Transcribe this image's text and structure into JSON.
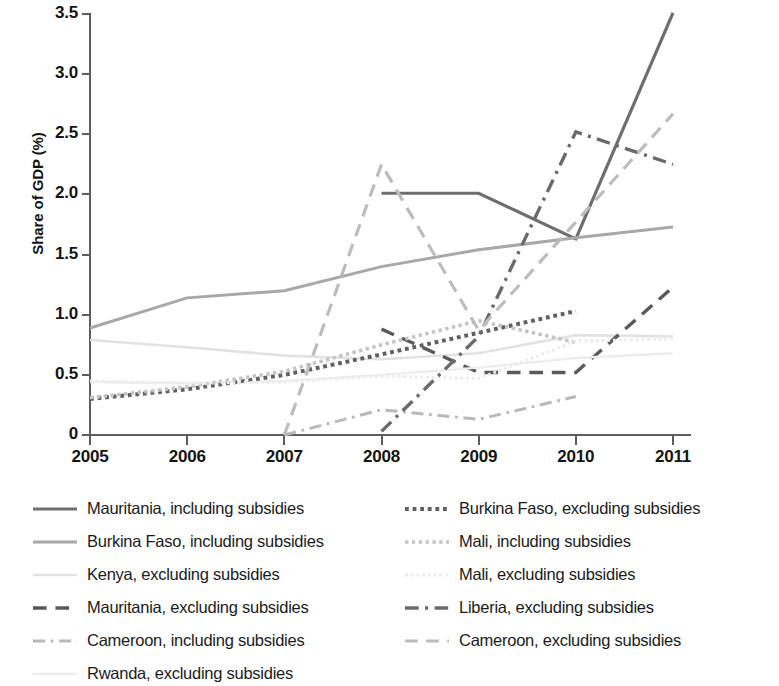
{
  "chart_data": {
    "type": "line",
    "title": "",
    "xlabel": "",
    "ylabel": "Share of GDP (%)",
    "x": [
      2005,
      2006,
      2007,
      2008,
      2009,
      2010,
      2011
    ],
    "xtick_labels": [
      "2005",
      "2006",
      "2007",
      "2008",
      "2009",
      "2010",
      "2011"
    ],
    "ytick_labels": [
      "0",
      "0.5",
      "1.0",
      "1.5",
      "2.0",
      "2.5",
      "3.0",
      "3.5"
    ],
    "ytick_values": [
      0,
      0.5,
      1.0,
      1.5,
      2.0,
      2.5,
      3.0,
      3.5
    ],
    "ylim": [
      0,
      3.5
    ],
    "xlim": [
      2005,
      2011
    ],
    "grid": false,
    "legend_position": "below",
    "series": [
      {
        "name": "Mauritania, including subsidies",
        "style": "solid",
        "color": "#6e6e6e",
        "width": 3.2,
        "x": [
          2008,
          2009,
          2010,
          2011
        ],
        "values": [
          2.01,
          2.01,
          1.63,
          3.51
        ]
      },
      {
        "name": "Burkina Faso, including subsidies",
        "style": "solid",
        "color": "#a8a8a8",
        "width": 3.0,
        "x": [
          2005,
          2006,
          2007,
          2008,
          2009,
          2010,
          2011
        ],
        "values": [
          0.89,
          1.14,
          1.2,
          1.4,
          1.54,
          1.64,
          1.73
        ]
      },
      {
        "name": "Kenya, excluding subsidies",
        "style": "solid",
        "color": "#e2e2e2",
        "width": 2.6,
        "x": [
          2005,
          2006,
          2007,
          2008,
          2009,
          2010,
          2011
        ],
        "values": [
          0.79,
          0.73,
          0.66,
          0.63,
          0.68,
          0.83,
          0.82
        ]
      },
      {
        "name": "Mauritania, excluding subsidies",
        "style": "dashed",
        "color": "#5a5a5a",
        "width": 3.4,
        "x": [
          2008,
          2009,
          2010,
          2011
        ],
        "values": [
          0.88,
          0.52,
          0.52,
          1.23
        ]
      },
      {
        "name": "Cameroon, including subsidies",
        "style": "dashdot",
        "color": "#b9b9b9",
        "width": 3.0,
        "x": [
          2007,
          2008,
          2009,
          2010
        ],
        "values": [
          0.0,
          0.21,
          0.13,
          0.32
        ]
      },
      {
        "name": "Rwanda, excluding subsidies",
        "style": "solid",
        "color": "#ededed",
        "width": 2.4,
        "x": [
          2005,
          2006,
          2007,
          2008,
          2009,
          2010,
          2011
        ],
        "values": [
          0.44,
          0.43,
          0.45,
          0.5,
          0.56,
          0.64,
          0.68
        ]
      },
      {
        "name": "Burkina Faso, excluding subsidies",
        "style": "dotted",
        "color": "#606060",
        "width": 4.0,
        "x": [
          2005,
          2006,
          2007,
          2008,
          2009,
          2010
        ],
        "values": [
          0.3,
          0.38,
          0.5,
          0.67,
          0.85,
          1.03
        ]
      },
      {
        "name": "Mali, including subsidies",
        "style": "dotted",
        "color": "#c4c4c4",
        "width": 3.6,
        "x": [
          2005,
          2006,
          2007,
          2008,
          2009,
          2010
        ],
        "values": [
          0.31,
          0.4,
          0.53,
          0.75,
          0.95,
          0.77
        ]
      },
      {
        "name": "Mali, excluding subsidies",
        "style": "dotted",
        "color": "#ececec",
        "width": 3.0,
        "x": [
          2005,
          2006,
          2007,
          2008,
          2009,
          2010,
          2011
        ],
        "values": [
          0.45,
          0.43,
          0.44,
          0.49,
          0.47,
          0.78,
          0.8
        ]
      },
      {
        "name": "Liberia, excluding subsidies",
        "style": "dashdot",
        "color": "#6a6a6a",
        "width": 3.4,
        "x": [
          2008,
          2009,
          2010,
          2011
        ],
        "values": [
          0.03,
          0.82,
          2.52,
          2.25
        ]
      },
      {
        "name": "Cameroon, excluding subsidies",
        "style": "dashed",
        "color": "#bcbcbc",
        "width": 3.2,
        "x": [
          2007,
          2008,
          2009,
          2010,
          2011
        ],
        "values": [
          0.0,
          2.25,
          0.87,
          1.77,
          2.67
        ]
      }
    ]
  },
  "axis": {
    "y_title": "Share of GDP (%)"
  },
  "legend": {
    "items": [
      {
        "label": "Mauritania, including subsidies",
        "swatch": "solid-dark-line-icon"
      },
      {
        "label": "Burkina Faso, excluding subsidies",
        "swatch": "dotted-dark-line-icon"
      },
      {
        "label": "Burkina Faso, including subsidies",
        "swatch": "solid-gray-line-icon"
      },
      {
        "label": "Mali, including subsidies",
        "swatch": "dotted-gray-line-icon"
      },
      {
        "label": "Kenya, excluding subsidies",
        "swatch": "solid-lightgray-line-icon"
      },
      {
        "label": "Mali, excluding subsidies",
        "swatch": "dotted-lightgray-line-icon"
      },
      {
        "label": "Mauritania, excluding subsidies",
        "swatch": "dashed-dark-line-icon"
      },
      {
        "label": "Liberia, excluding subsidies",
        "swatch": "dashdot-dark-line-icon"
      },
      {
        "label": "Cameroon, including subsidies",
        "swatch": "dashdot-gray-line-icon"
      },
      {
        "label": "Cameroon, excluding subsidies",
        "swatch": "dashed-gray-line-icon"
      },
      {
        "label": "Rwanda, excluding subsidies",
        "swatch": "solid-faint-line-icon"
      }
    ]
  }
}
